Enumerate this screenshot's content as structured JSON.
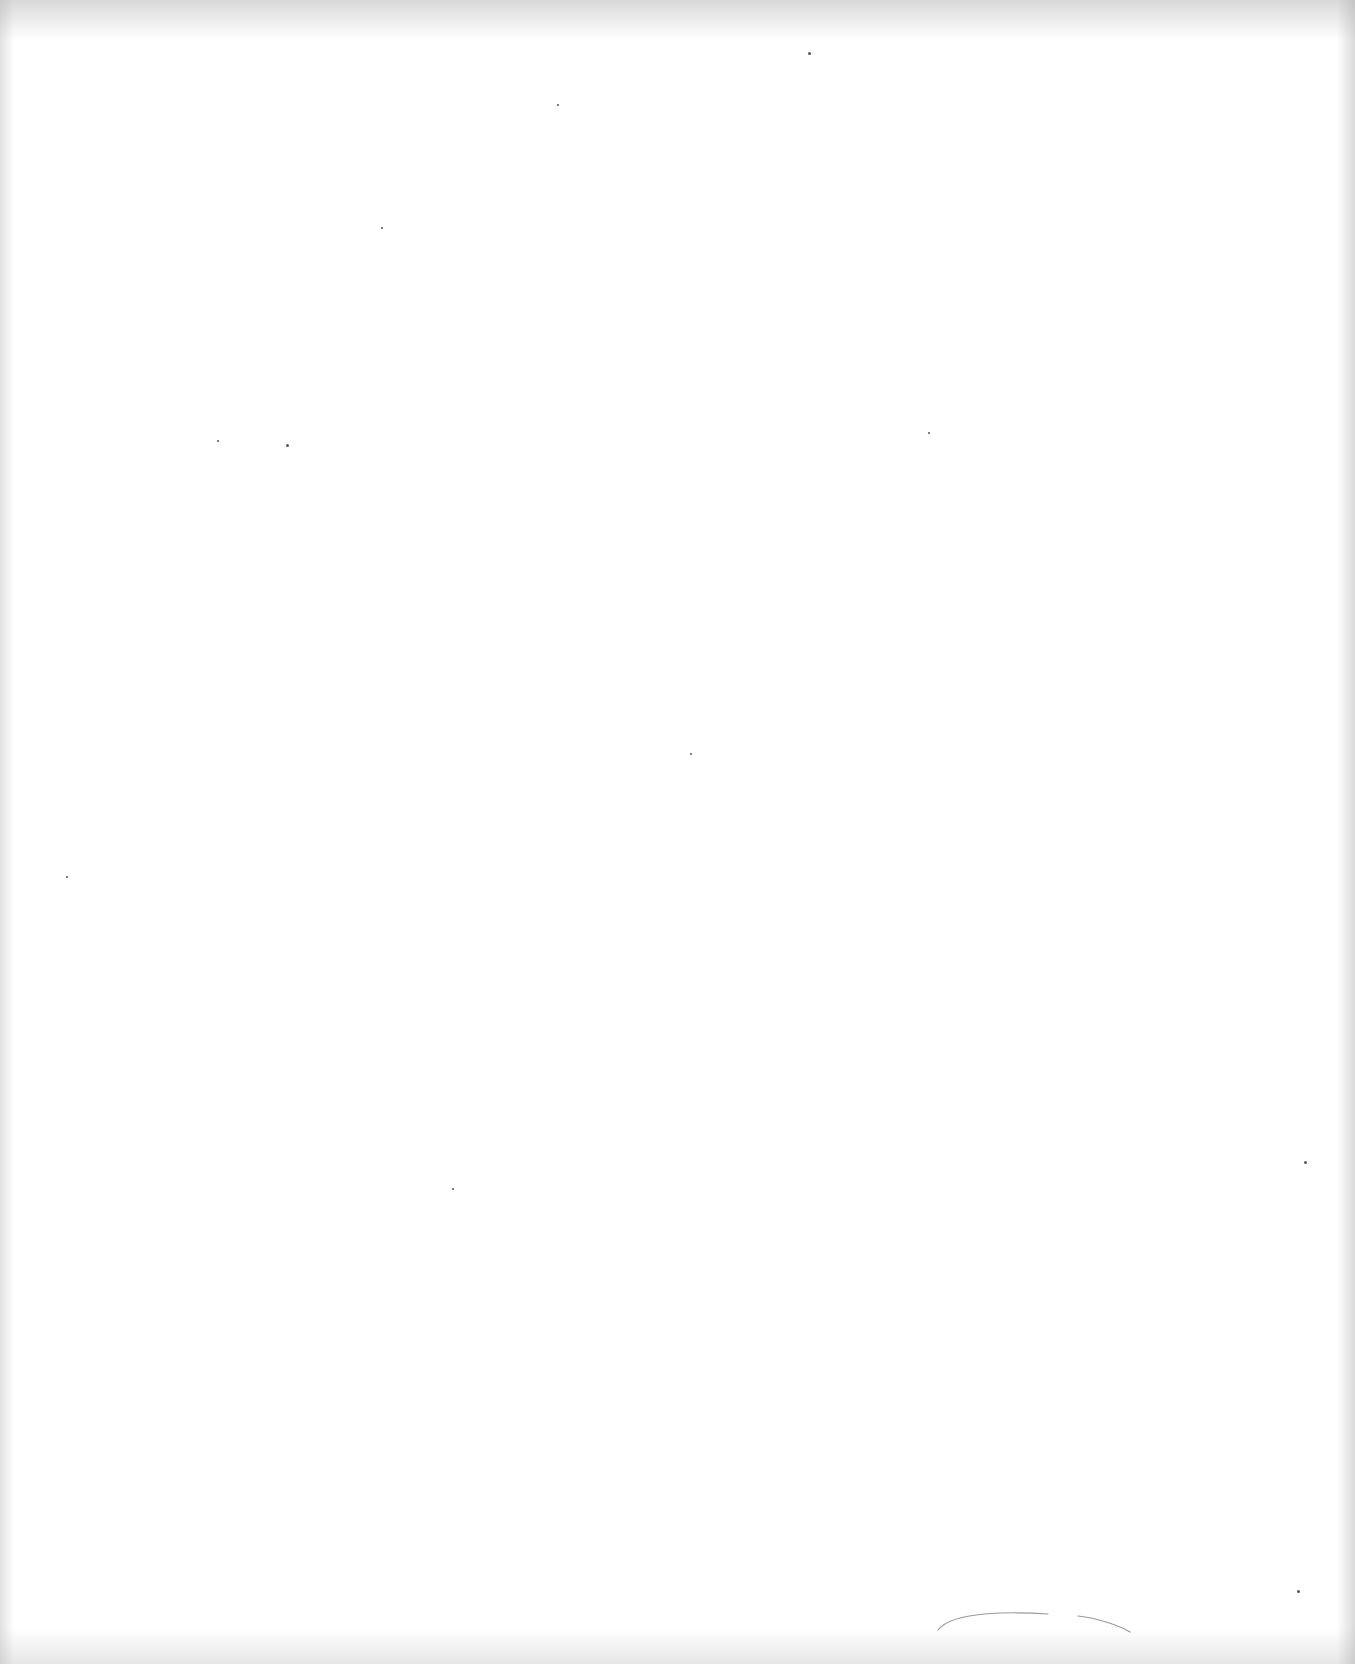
{
  "document": {
    "type": "scanned-blank-page",
    "text": "",
    "marks": [
      {
        "kind": "speck",
        "x": 808,
        "y": 52,
        "size": 3
      },
      {
        "kind": "speck",
        "x": 557,
        "y": 104,
        "size": 2
      },
      {
        "kind": "speck",
        "x": 381,
        "y": 227,
        "size": 2
      },
      {
        "kind": "speck",
        "x": 286,
        "y": 444,
        "size": 3
      },
      {
        "kind": "speck",
        "x": 217,
        "y": 440,
        "size": 2
      },
      {
        "kind": "speck",
        "x": 928,
        "y": 432,
        "size": 2
      },
      {
        "kind": "speck",
        "x": 690,
        "y": 753,
        "size": 2
      },
      {
        "kind": "speck",
        "x": 66,
        "y": 876,
        "size": 2
      },
      {
        "kind": "speck",
        "x": 452,
        "y": 1188,
        "size": 2
      },
      {
        "kind": "speck",
        "x": 1304,
        "y": 1161,
        "size": 3
      },
      {
        "kind": "speck",
        "x": 1297,
        "y": 1590,
        "size": 3
      }
    ],
    "stroke": {
      "kind": "faint-curve",
      "from": [
        938,
        1630
      ],
      "to": [
        1130,
        1632
      ]
    }
  }
}
